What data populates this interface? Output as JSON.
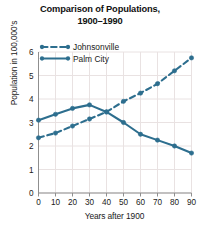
{
  "chart_data": {
    "type": "line",
    "title": "Comparison of Populations, 1900–1990",
    "title_line1": "Comparison of Populations,",
    "title_line2": "1900–1990",
    "xlabel": "Years after 1900",
    "ylabel": "Population in 100,000's",
    "x": [
      0,
      10,
      20,
      30,
      40,
      50,
      60,
      70,
      80,
      90
    ],
    "xticklabels": [
      "0",
      "10",
      "20",
      "30",
      "40",
      "50",
      "60",
      "70",
      "80",
      "90"
    ],
    "yticklabels": [
      "0",
      "1",
      "2",
      "3",
      "4",
      "5",
      "6"
    ],
    "yticks": [
      0,
      1,
      2,
      3,
      4,
      5,
      6
    ],
    "xlim": [
      0,
      90
    ],
    "ylim": [
      0,
      6
    ],
    "grid": true,
    "legend_position": "upper-left-inside",
    "series": [
      {
        "name": "Johnsonville",
        "style": "dashed",
        "marker": "circle",
        "color": "#2d6e8e",
        "values": [
          2.35,
          2.55,
          2.85,
          3.15,
          3.45,
          3.9,
          4.25,
          4.65,
          5.2,
          5.75
        ]
      },
      {
        "name": "Palm City",
        "style": "solid",
        "marker": "circle",
        "color": "#2d6e8e",
        "values": [
          3.1,
          3.35,
          3.6,
          3.75,
          3.45,
          3.0,
          2.5,
          2.25,
          2.0,
          1.7
        ]
      }
    ],
    "colors": {
      "line": "#2d6e8e",
      "grid": "#e9e2e2",
      "axis": "#8f8f8f",
      "text": "#1a1a1a",
      "background": "#ffffff"
    }
  }
}
